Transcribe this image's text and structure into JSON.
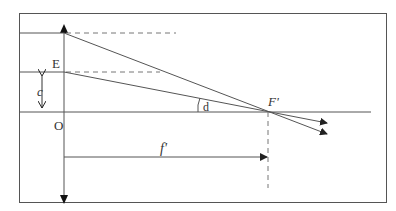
{
  "diagram": {
    "type": "optics-lens-focus",
    "labels": {
      "E": "E",
      "c": "c",
      "O": "O",
      "d": "d",
      "F_prime": "F'",
      "f_prime": "f'"
    },
    "colors": {
      "stroke": "#444444",
      "background": "#ffffff"
    }
  }
}
